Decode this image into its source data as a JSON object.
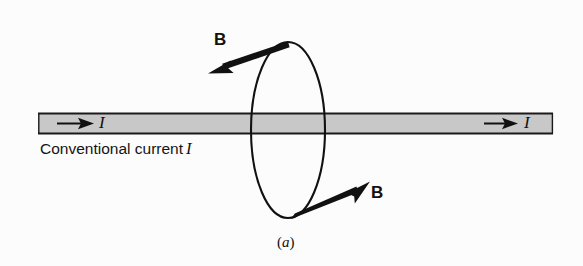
{
  "figure": {
    "caption": "(a)",
    "caption_italic_part": "a",
    "background_color": "#fcfcfc",
    "ink_color": "#111111"
  },
  "wire": {
    "label_left_current": "I",
    "label_right_current": "I",
    "description_text": "Conventional current",
    "description_symbol": "I",
    "fill_color": "#c8c8c8",
    "edge_color": "#1a1a1a",
    "arrow_direction": "right",
    "x_start": 38,
    "x_end": 553,
    "y_top": 113,
    "y_bottom": 134
  },
  "field_loop": {
    "name": "magnetic-field-circle",
    "center_x": 288,
    "center_y": 130,
    "radius_x": 37,
    "radius_y": 88,
    "stroke_color": "#111111"
  },
  "field_vectors": [
    {
      "label": "B",
      "position": "top",
      "tail_x": 288,
      "tail_y": 44,
      "tip_x": 211,
      "tip_y": 71,
      "direction": "up-left"
    },
    {
      "label": "B",
      "position": "bottom",
      "tail_x": 293,
      "tail_y": 216,
      "tip_x": 367,
      "tip_y": 184,
      "direction": "up-right"
    }
  ]
}
